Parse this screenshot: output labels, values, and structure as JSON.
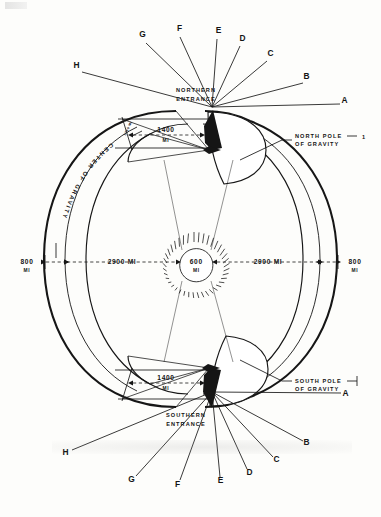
{
  "diagram": {
    "ink_color": "#161616",
    "paper_color": "#fdfdfb"
  },
  "captions": {
    "northern_entrance_line1": "NORTHERN",
    "northern_entrance_line2": "ENTRANCE",
    "southern_entrance_line1": "SOUTHERN",
    "southern_entrance_line2": "ENTRANCE",
    "north_pole_line1": "NORTH POLE",
    "north_pole_line2": "OF GRAVITY",
    "north_pole_index": "1",
    "south_pole_line1": "SOUTH POLE",
    "south_pole_line2": "OF GRAVITY",
    "center_of_gravity": "CENTER OF GRAVITY"
  },
  "dimensions": {
    "north_entrance_width": "1400",
    "north_entrance_unit": "MI",
    "south_entrance_width": "1400",
    "south_entrance_unit": "MI",
    "left_shell": "800",
    "left_shell_unit": "MI",
    "right_shell": "800",
    "right_shell_unit": "MI",
    "left_radius": "2900 MI",
    "right_radius": "2900 MI",
    "sun_diameter": "600",
    "sun_unit": "MI",
    "neck_angle_label": "1750 MI"
  },
  "ray_labels_north": [
    {
      "id": "A",
      "x": 345,
      "y": 103
    },
    {
      "id": "B",
      "x": 307,
      "y": 79
    },
    {
      "id": "C",
      "x": 271,
      "y": 56
    },
    {
      "id": "D",
      "x": 243,
      "y": 41
    },
    {
      "id": "E",
      "x": 219,
      "y": 33
    },
    {
      "id": "F",
      "x": 180,
      "y": 31
    },
    {
      "id": "G",
      "x": 143,
      "y": 37
    },
    {
      "id": "H",
      "x": 77,
      "y": 68
    }
  ],
  "ray_labels_south": [
    {
      "id": "A",
      "x": 346,
      "y": 396
    },
    {
      "id": "B",
      "x": 307,
      "y": 445
    },
    {
      "id": "C",
      "x": 277,
      "y": 462
    },
    {
      "id": "D",
      "x": 250,
      "y": 475
    },
    {
      "id": "E",
      "x": 221,
      "y": 483
    },
    {
      "id": "F",
      "x": 178,
      "y": 487
    },
    {
      "id": "G",
      "x": 132,
      "y": 482
    },
    {
      "id": "H",
      "x": 66,
      "y": 455
    }
  ]
}
